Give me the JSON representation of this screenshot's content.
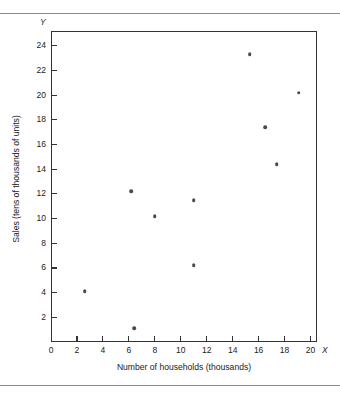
{
  "figure": {
    "rules": [
      "top-rule",
      "bottom-rule"
    ]
  },
  "chart_data": {
    "type": "scatter",
    "title": "",
    "subtitle": "",
    "xlabel": "Number of households (thousands)",
    "ylabel": "Sales (tens of thousands of units)",
    "x_axis_symbol": "X",
    "y_axis_symbol": "Y",
    "xlim": [
      0,
      20.5
    ],
    "ylim": [
      0,
      25.2
    ],
    "xticks": [
      0,
      2,
      4,
      6,
      8,
      10,
      12,
      14,
      16,
      18,
      20
    ],
    "xtick_labels": [
      "0",
      "2",
      "4",
      "6",
      "8",
      "10",
      "12",
      "14",
      "16",
      "18",
      "20"
    ],
    "yticks": [
      2,
      4,
      6,
      8,
      10,
      12,
      14,
      16,
      18,
      20,
      22,
      24
    ],
    "ytick_labels": [
      "2",
      "4",
      "6",
      "8",
      "10",
      "12",
      "14",
      "16",
      "18",
      "20",
      "22",
      "24"
    ],
    "grid": false,
    "legend": null,
    "marker_color": "#4a4a4a",
    "axis_color": "#333333",
    "points": [
      {
        "x": 2.6,
        "y": 4.1
      },
      {
        "x": 6.4,
        "y": 1.1
      },
      {
        "x": 6.2,
        "y": 12.2
      },
      {
        "x": 8.0,
        "y": 10.2
      },
      {
        "x": 11.0,
        "y": 11.5
      },
      {
        "x": 11.0,
        "y": 6.2
      },
      {
        "x": 15.3,
        "y": 23.3
      },
      {
        "x": 16.5,
        "y": 17.4
      },
      {
        "x": 17.4,
        "y": 14.4
      },
      {
        "x": 19.1,
        "y": 20.2
      }
    ]
  }
}
